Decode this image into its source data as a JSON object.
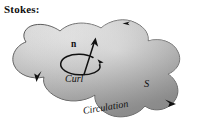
{
  "figure": {
    "title": "Stokes:",
    "type": "stokes-theorem-diagram",
    "labels": {
      "normal_vector": "n",
      "curl": "Curl",
      "surface": "S",
      "circulation": "Circulation"
    },
    "colors": {
      "ink": "#111111",
      "surface_light": "#e2e2e2",
      "surface_mid": "#b8b8b8",
      "surface_dark": "#8e8e8e",
      "outline": "#3a3a3a",
      "background": "#ffffff"
    },
    "boundary_arrows": [
      {
        "name": "top-edge-arrow",
        "direction": "left"
      },
      {
        "name": "left-edge-arrow",
        "direction": "down-left"
      },
      {
        "name": "bottom-right-edge-arrow",
        "direction": "right"
      }
    ],
    "curl_loop": {
      "name": "curl-circulation-loop",
      "direction": "counterclockwise"
    }
  }
}
